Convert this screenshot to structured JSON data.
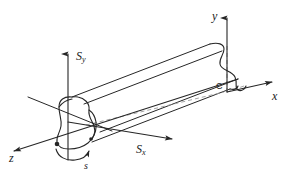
{
  "figure": {
    "background_color": "#ffffff",
    "line_color": "#262626",
    "dashed_color": "#8c8c8c",
    "label_color": "#1a1a1a"
  },
  "labels": {
    "axis_y": "y",
    "axis_x": "x",
    "axis_z": "z",
    "shear_y_main": "S",
    "shear_y_sub": "y",
    "shear_x_main": "S",
    "shear_x_sub": "x",
    "centroid": "C",
    "twist": "s"
  },
  "elements": {
    "beam_name": "prismatic-beam-body",
    "near_section_name": "near-end-cross-section",
    "far_section_name": "far-end-cross-section",
    "centroid_axis_name": "centroidal-dashed-axis",
    "twist_arrow_name": "twist-rotation-arrow"
  },
  "geometry": {
    "y_axis": {
      "x": 227,
      "y_top": 14,
      "y_bottom": 92
    },
    "x_axis": {
      "x1": 227,
      "y1": 92,
      "x2": 276,
      "y2": 81
    },
    "z_axis": {
      "x1": 118,
      "y1": 117,
      "x2": 10,
      "y2": 152
    },
    "shear_y_axis": {
      "x": 68,
      "y_top": 50,
      "y_bottom": 160
    },
    "shear_x_axis": {
      "x1": 68,
      "y1": 122,
      "x2": 176,
      "y2": 140
    },
    "centroid_point": {
      "x": 227,
      "y": 92
    },
    "twist_center": {
      "x": 70,
      "y": 152
    }
  }
}
